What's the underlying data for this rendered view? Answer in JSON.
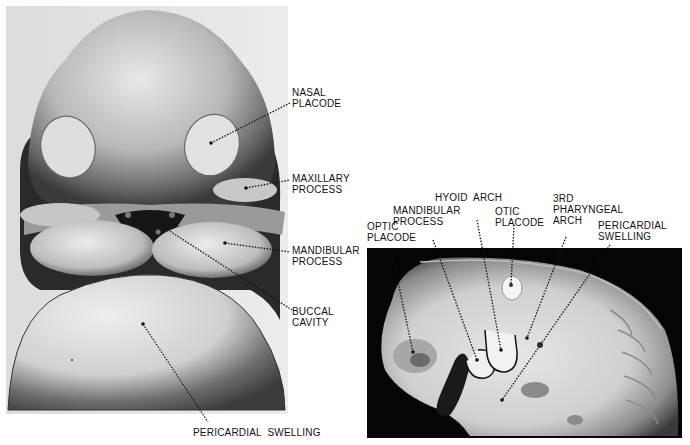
{
  "figure": {
    "left_panel": {
      "description": "Frontal view drawing of embryo head",
      "labels": {
        "nasal_placode": "NASAL\nPLACODE",
        "maxillary_process": "MAXILLARY\nPROCESS",
        "mandibular_process": "MANDIBULAR\nPROCESS",
        "buccal_cavity": "BUCCAL\nCAVITY",
        "pericardial_swelling": "PERICARDIAL  SWELLING"
      }
    },
    "right_panel": {
      "description": "Lateral view photograph of embryo",
      "labels": {
        "optic_placode": "OPTIC\nPLACODE",
        "mandibular_process": "MANDIBULAR\nPROCESS",
        "hyoid_arch": "HYOID  ARCH",
        "otic_placode": "OTIC\nPLACODE",
        "third_pharyngeal_arch": "3RD\nPHARYNGEAL\nARCH",
        "pericardial_swelling": "PERICARDIAL\nSWELLING"
      }
    }
  }
}
